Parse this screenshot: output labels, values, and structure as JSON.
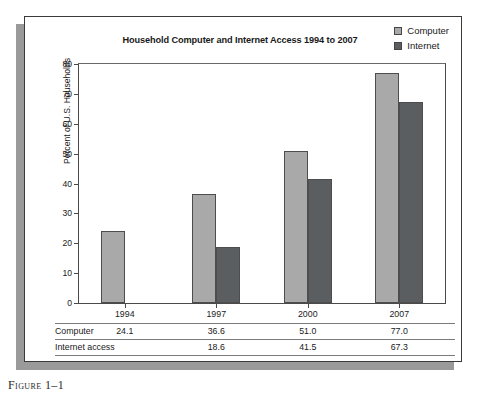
{
  "figure": {
    "caption": "Figure 1–1"
  },
  "legend": [
    {
      "label": "Computer",
      "color": "#a9a9a9",
      "icon": "legend-swatch-icon"
    },
    {
      "label": "Internet",
      "color": "#5b5e61",
      "icon": "legend-swatch-icon"
    }
  ],
  "axis": {
    "y_title": "Percent of U.S. Households",
    "y_ticks": [
      "0",
      "10",
      "20",
      "30",
      "40",
      "50",
      "60",
      "70",
      "80"
    ]
  },
  "table": {
    "row_labels": [
      "Computer",
      "Internet access"
    ],
    "computer_cells": [
      "24.1",
      "36.6",
      "51.0",
      "77.0"
    ],
    "internet_cells": [
      "",
      "18.6",
      "41.5",
      "67.3"
    ]
  },
  "chart_data": {
    "type": "bar",
    "title": "Household Computer and Internet Access 1994 to 2007",
    "xlabel": "",
    "ylabel": "Percent of U.S. Households",
    "ylim": [
      0,
      80
    ],
    "ytick_interval": 10,
    "grid": false,
    "legend_position": "top-right",
    "categories": [
      "1994",
      "1997",
      "2000",
      "2007"
    ],
    "series": [
      {
        "name": "Computer",
        "color": "#a9a9a9",
        "values": [
          24.1,
          36.6,
          51.0,
          77.0
        ]
      },
      {
        "name": "Internet",
        "color": "#5b5e61",
        "values": [
          null,
          18.6,
          41.5,
          67.3
        ]
      }
    ]
  }
}
